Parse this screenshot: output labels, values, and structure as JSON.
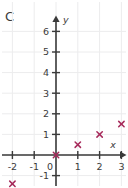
{
  "panel": {
    "label": "C"
  },
  "chart_data": {
    "type": "scatter",
    "title": "",
    "xlabel": "x",
    "ylabel": "y",
    "grid": true,
    "legend": false,
    "xlim": [
      -2.6,
      3.7
    ],
    "ylim": [
      -1.7,
      6.8
    ],
    "xticks": [
      -2,
      -1,
      0,
      1,
      2,
      3
    ],
    "xticklabels": [
      "-2",
      "-1",
      "0",
      "1",
      "2",
      "3"
    ],
    "yticks": [
      -1,
      1,
      2,
      3,
      4,
      5,
      6
    ],
    "yticklabels": [
      "-1",
      "1",
      "2",
      "3",
      "4",
      "5",
      "6"
    ],
    "origin_label": "0",
    "marker": "x",
    "marker_color": "#a6295a",
    "points": [
      {
        "x": -2,
        "y": -1.4
      },
      {
        "x": 0,
        "y": 0
      },
      {
        "x": 1,
        "y": 0.5
      },
      {
        "x": 2,
        "y": 1
      },
      {
        "x": 3,
        "y": 1.5
      }
    ]
  },
  "colors": {
    "marker": "#a6295a",
    "axis": "#3a3a3a",
    "grid": "#ececed",
    "text": "#3b3b3b"
  }
}
